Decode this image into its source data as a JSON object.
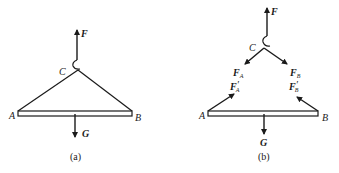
{
  "figure": {
    "panel_a": {
      "caption": "(a)",
      "labels": {
        "F": "F",
        "C": "C",
        "A": "A",
        "B": "B",
        "G": "G"
      }
    },
    "panel_b": {
      "caption": "(b)",
      "labels": {
        "F": "F",
        "C": "C",
        "A": "A",
        "B": "B",
        "G": "G",
        "FA": "F",
        "FA_sub": "A",
        "FB": "F",
        "FB_sub": "B",
        "FA_prime": "F",
        "FA_prime_sub": "A",
        "FA_prime_mark": "′",
        "FB_prime": "F",
        "FB_prime_sub": "B",
        "FB_prime_mark": "′"
      }
    },
    "colors": {
      "stroke": "#1a1a1a",
      "background": "#ffffff"
    }
  }
}
